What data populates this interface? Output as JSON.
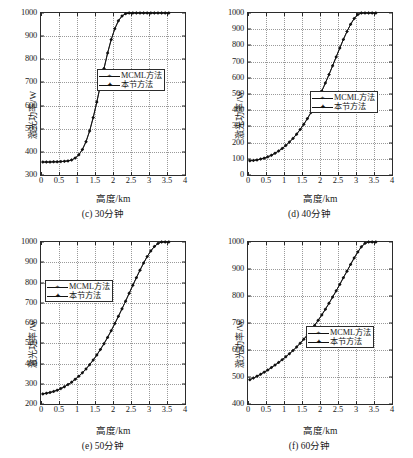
{
  "figure": {
    "type": "multi-panel-line-chart",
    "panels": 4
  },
  "axis": {
    "xlabel": "高度/km",
    "ylabel": "激光功率/W",
    "xticks": [
      "0",
      "0.5",
      "1",
      "1.5",
      "2",
      "2.5",
      "3",
      "3.5",
      "4"
    ]
  },
  "legend": {
    "series1": "MCML方法",
    "series2": "本节方法",
    "marker1": "+",
    "marker2": "✦"
  },
  "captions": {
    "c": "(c) 30分钟",
    "d": "(d) 40分钟",
    "e": "(e) 50分钟",
    "f": "(f) 60分钟"
  },
  "colors": {
    "line": "#111111",
    "axis": "#2b2b2b",
    "grid": "#9a9a9a",
    "background": "#ffffff"
  },
  "chart_data": [
    {
      "type": "line",
      "panel": "c",
      "title": "(c) 30分钟",
      "xlabel": "高度/km",
      "ylabel": "激光功率/W",
      "xlim": [
        0,
        4
      ],
      "ylim": [
        300,
        1000
      ],
      "xticks": [
        0,
        0.5,
        1,
        1.5,
        2,
        2.5,
        3,
        3.5,
        4
      ],
      "yticks": [
        300,
        400,
        500,
        600,
        700,
        800,
        900,
        1000
      ],
      "grid": true,
      "legend_position": "center-right",
      "series": [
        {
          "name": "MCML方法",
          "x": [
            0.05,
            0.15,
            0.25,
            0.35,
            0.45,
            0.55,
            0.65,
            0.75,
            0.85,
            0.95,
            1.05,
            1.15,
            1.25,
            1.35,
            1.45,
            1.55,
            1.65,
            1.75,
            1.85,
            1.95,
            2.05,
            2.15,
            2.25,
            2.35,
            2.45,
            2.55,
            2.65,
            2.75,
            2.85,
            2.95,
            3.05,
            3.15,
            3.25,
            3.35,
            3.45,
            3.55
          ],
          "values": [
            356,
            356,
            356,
            357,
            357,
            358,
            359,
            361,
            365,
            373,
            387,
            410,
            444,
            490,
            548,
            615,
            688,
            760,
            827,
            885,
            932,
            966,
            987,
            997,
            1000,
            1000,
            1000,
            1000,
            1000,
            1000,
            1000,
            1000,
            1000,
            1000,
            1000,
            1000
          ]
        },
        {
          "name": "本节方法",
          "x": [
            0.05,
            0.15,
            0.25,
            0.35,
            0.45,
            0.55,
            0.65,
            0.75,
            0.85,
            0.95,
            1.05,
            1.15,
            1.25,
            1.35,
            1.45,
            1.55,
            1.65,
            1.75,
            1.85,
            1.95,
            2.05,
            2.15,
            2.25,
            2.35,
            2.45,
            2.55,
            2.65,
            2.75,
            2.85,
            2.95,
            3.05,
            3.15,
            3.25,
            3.35,
            3.45,
            3.55
          ],
          "values": [
            356,
            356,
            356,
            357,
            357,
            358,
            359,
            361,
            365,
            373,
            387,
            410,
            444,
            490,
            548,
            615,
            688,
            760,
            827,
            885,
            932,
            966,
            987,
            997,
            1000,
            1000,
            1000,
            1000,
            1000,
            1000,
            1000,
            1000,
            1000,
            1000,
            1000,
            1000
          ]
        }
      ]
    },
    {
      "type": "line",
      "panel": "d",
      "title": "(d) 40分钟",
      "xlabel": "高度/km",
      "ylabel": "激光功率/W",
      "xlim": [
        0,
        4
      ],
      "ylim": [
        0,
        1000
      ],
      "xticks": [
        0,
        0.5,
        1,
        1.5,
        2,
        2.5,
        3,
        3.5,
        4
      ],
      "yticks": [
        0,
        100,
        200,
        300,
        400,
        500,
        600,
        700,
        800,
        900,
        1000
      ],
      "grid": true,
      "legend_position": "center-right",
      "series": [
        {
          "name": "MCML方法",
          "x": [
            0.05,
            0.15,
            0.25,
            0.35,
            0.45,
            0.55,
            0.65,
            0.75,
            0.85,
            0.95,
            1.05,
            1.15,
            1.25,
            1.35,
            1.45,
            1.55,
            1.65,
            1.75,
            1.85,
            1.95,
            2.05,
            2.15,
            2.25,
            2.35,
            2.45,
            2.55,
            2.65,
            2.75,
            2.85,
            2.95,
            3.05,
            3.15,
            3.25,
            3.35,
            3.45,
            3.55
          ],
          "values": [
            88,
            90,
            93,
            98,
            104,
            112,
            122,
            134,
            148,
            164,
            182,
            203,
            226,
            252,
            281,
            313,
            348,
            386,
            427,
            471,
            518,
            568,
            620,
            674,
            729,
            784,
            837,
            886,
            930,
            966,
            990,
            1000,
            1000,
            1000,
            1000,
            1000
          ]
        },
        {
          "name": "本节方法",
          "x": [
            0.05,
            0.15,
            0.25,
            0.35,
            0.45,
            0.55,
            0.65,
            0.75,
            0.85,
            0.95,
            1.05,
            1.15,
            1.25,
            1.35,
            1.45,
            1.55,
            1.65,
            1.75,
            1.85,
            1.95,
            2.05,
            2.15,
            2.25,
            2.35,
            2.45,
            2.55,
            2.65,
            2.75,
            2.85,
            2.95,
            3.05,
            3.15,
            3.25,
            3.35,
            3.45,
            3.55
          ],
          "values": [
            88,
            90,
            93,
            98,
            104,
            112,
            122,
            134,
            148,
            164,
            182,
            203,
            226,
            252,
            281,
            313,
            348,
            386,
            427,
            471,
            518,
            568,
            620,
            674,
            729,
            784,
            837,
            886,
            930,
            966,
            990,
            1000,
            1000,
            1000,
            1000,
            1000
          ]
        }
      ]
    },
    {
      "type": "line",
      "panel": "e",
      "title": "(e) 50分钟",
      "xlabel": "高度/km",
      "ylabel": "激光功率/W",
      "xlim": [
        0,
        4
      ],
      "ylim": [
        200,
        1000
      ],
      "xticks": [
        0,
        0.5,
        1,
        1.5,
        2,
        2.5,
        3,
        3.5,
        4
      ],
      "yticks": [
        200,
        300,
        400,
        500,
        600,
        700,
        800,
        900,
        1000
      ],
      "grid": true,
      "legend_position": "upper-left",
      "series": [
        {
          "name": "MCML方法",
          "x": [
            0.05,
            0.15,
            0.25,
            0.35,
            0.45,
            0.55,
            0.65,
            0.75,
            0.85,
            0.95,
            1.05,
            1.15,
            1.25,
            1.35,
            1.45,
            1.55,
            1.65,
            1.75,
            1.85,
            1.95,
            2.05,
            2.15,
            2.25,
            2.35,
            2.45,
            2.55,
            2.65,
            2.75,
            2.85,
            2.95,
            3.05,
            3.15,
            3.25,
            3.35,
            3.45,
            3.55
          ],
          "values": [
            250,
            253,
            257,
            262,
            268,
            276,
            285,
            296,
            308,
            322,
            337,
            354,
            373,
            394,
            417,
            442,
            469,
            498,
            529,
            562,
            597,
            633,
            670,
            708,
            747,
            786,
            824,
            861,
            896,
            928,
            956,
            978,
            993,
            1000,
            1000,
            1000
          ]
        },
        {
          "name": "本节方法",
          "x": [
            0.05,
            0.15,
            0.25,
            0.35,
            0.45,
            0.55,
            0.65,
            0.75,
            0.85,
            0.95,
            1.05,
            1.15,
            1.25,
            1.35,
            1.45,
            1.55,
            1.65,
            1.75,
            1.85,
            1.95,
            2.05,
            2.15,
            2.25,
            2.35,
            2.45,
            2.55,
            2.65,
            2.75,
            2.85,
            2.95,
            3.05,
            3.15,
            3.25,
            3.35,
            3.45,
            3.55
          ],
          "values": [
            250,
            253,
            257,
            262,
            268,
            276,
            285,
            296,
            308,
            322,
            337,
            354,
            373,
            394,
            417,
            442,
            469,
            498,
            529,
            562,
            597,
            633,
            670,
            708,
            747,
            786,
            824,
            861,
            896,
            928,
            956,
            978,
            993,
            1000,
            1000,
            1000
          ]
        }
      ]
    },
    {
      "type": "line",
      "panel": "f",
      "title": "(f) 60分钟",
      "xlabel": "高度/km",
      "ylabel": "激光功率/W",
      "xlim": [
        0,
        4
      ],
      "ylim": [
        400,
        1000
      ],
      "xticks": [
        0,
        0.5,
        1,
        1.5,
        2,
        2.5,
        3,
        3.5,
        4
      ],
      "yticks": [
        400,
        500,
        600,
        700,
        800,
        900,
        1000
      ],
      "grid": true,
      "legend_position": "center-right",
      "series": [
        {
          "name": "MCML方法",
          "x": [
            0.05,
            0.15,
            0.25,
            0.35,
            0.45,
            0.55,
            0.65,
            0.75,
            0.85,
            0.95,
            1.05,
            1.15,
            1.25,
            1.35,
            1.45,
            1.55,
            1.65,
            1.75,
            1.85,
            1.95,
            2.05,
            2.15,
            2.25,
            2.35,
            2.45,
            2.55,
            2.65,
            2.75,
            2.85,
            2.95,
            3.05,
            3.15,
            3.25,
            3.35,
            3.45,
            3.55
          ],
          "values": [
            490,
            496,
            503,
            510,
            518,
            526,
            535,
            544,
            554,
            564,
            575,
            586,
            598,
            611,
            625,
            640,
            656,
            673,
            691,
            710,
            730,
            751,
            773,
            796,
            819,
            843,
            868,
            892,
            917,
            941,
            963,
            982,
            995,
            1000,
            1000,
            1000
          ]
        },
        {
          "name": "本节方法",
          "x": [
            0.05,
            0.15,
            0.25,
            0.35,
            0.45,
            0.55,
            0.65,
            0.75,
            0.85,
            0.95,
            1.05,
            1.15,
            1.25,
            1.35,
            1.45,
            1.55,
            1.65,
            1.75,
            1.85,
            1.95,
            2.05,
            2.15,
            2.25,
            2.35,
            2.45,
            2.55,
            2.65,
            2.75,
            2.85,
            2.95,
            3.05,
            3.15,
            3.25,
            3.35,
            3.45,
            3.55
          ],
          "values": [
            490,
            496,
            503,
            510,
            518,
            526,
            535,
            544,
            554,
            564,
            575,
            586,
            598,
            611,
            625,
            640,
            656,
            673,
            691,
            710,
            730,
            751,
            773,
            796,
            819,
            843,
            868,
            892,
            917,
            941,
            963,
            982,
            995,
            1000,
            1000,
            1000
          ]
        }
      ]
    }
  ]
}
